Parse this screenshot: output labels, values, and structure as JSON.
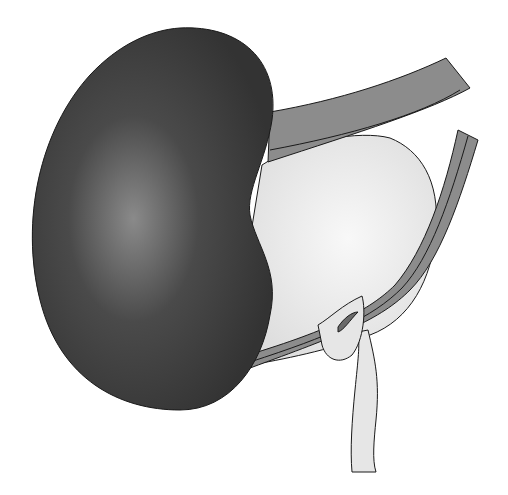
{
  "diagram": {
    "type": "anatomical-illustration",
    "labels": [],
    "colors": {
      "background": "#ffffff",
      "kidney_dark": "#3a3a3a",
      "kidney_highlight": "#8a8a8a",
      "bladder_fill": "#e8e8e8",
      "band_fill": "#8c8c8c",
      "tube_fill": "#e6e6e6",
      "outline": "#1a1a1a"
    },
    "elements": [
      {
        "name": "kidney",
        "description": "Large dark bean-shaped organ on left"
      },
      {
        "name": "bladder",
        "description": "Pale oval sac behind kidney"
      },
      {
        "name": "upper-band",
        "description": "Gray curved band across top right"
      },
      {
        "name": "right-band",
        "description": "Gray double-striped band wrapping right side and bottom"
      },
      {
        "name": "ureter",
        "description": "Pale tube descending downward from bottom right"
      }
    ]
  }
}
